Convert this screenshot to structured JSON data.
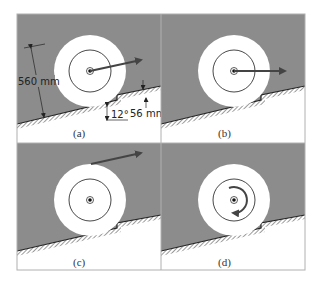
{
  "figure": {
    "colors": {
      "background": "#ffffff",
      "wall": "#8c8c8c",
      "wheel": "#ffffff",
      "ground_line": "#222222",
      "arrow": "#444444",
      "frame": "#b0b0b0"
    },
    "panels": [
      {
        "id": "a",
        "label": "(a)",
        "force": "arrow from center up-right, slightly inclined"
      },
      {
        "id": "b",
        "label": "(b)",
        "force": "horizontal arrow from center"
      },
      {
        "id": "c",
        "label": "(c)",
        "force": "arrow applied at top of wheel, inclined"
      },
      {
        "id": "d",
        "label": "(d)",
        "force": "counterclockwise couple (moment)"
      }
    ],
    "dimensions": {
      "diameter": "560 mm",
      "angle": "12°",
      "step_height": "56 mm"
    }
  }
}
